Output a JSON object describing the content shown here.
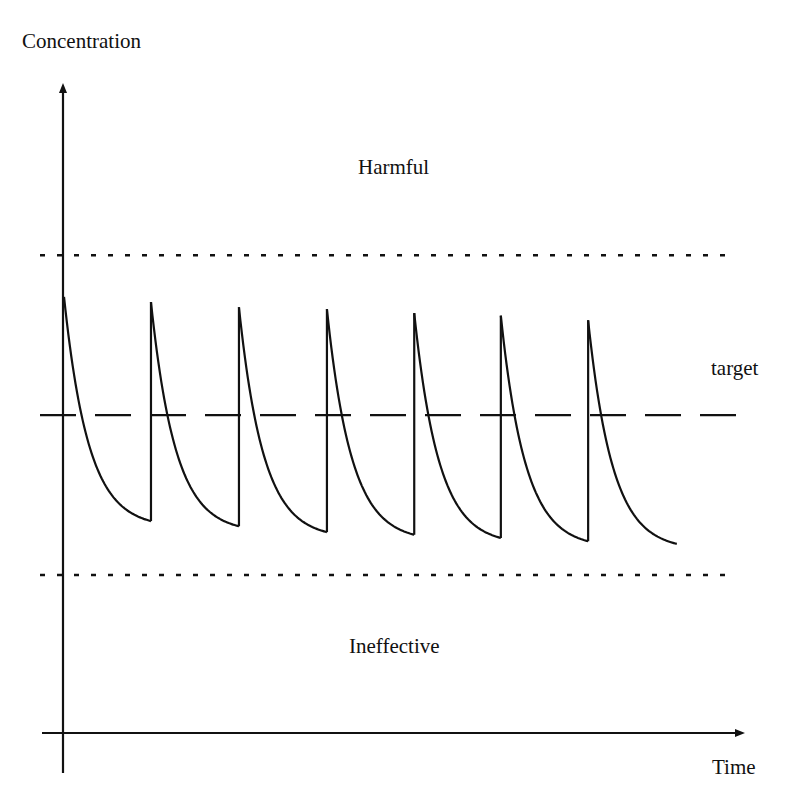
{
  "chart_data": {
    "type": "line",
    "title": "",
    "xlabel": "Time",
    "ylabel": "Concentration",
    "xlim": [
      0,
      100
    ],
    "ylim": [
      0,
      100
    ],
    "grid": false,
    "axis_ticks": false,
    "levels": {
      "harmful_threshold": 73.5,
      "target": 48.9,
      "ineffective_threshold": 24.3
    },
    "zone_labels": {
      "upper": "Harmful",
      "target": "target",
      "lower": "Ineffective"
    },
    "doses": [
      {
        "time": 0.15,
        "peak": 67.1,
        "trough_before_next": 32.6
      },
      {
        "time": 12.9,
        "peak": 66.3,
        "trough_before_next": 31.8
      },
      {
        "time": 25.8,
        "peak": 65.5,
        "trough_before_next": 30.9
      },
      {
        "time": 38.7,
        "peak": 65.2,
        "trough_before_next": 30.5
      },
      {
        "time": 51.5,
        "peak": 64.6,
        "trough_before_next": 30.0
      },
      {
        "time": 64.2,
        "peak": 64.2,
        "trough_before_next": 29.5
      },
      {
        "time": 77.0,
        "peak": 63.5,
        "trough_before_next": 29.1
      }
    ],
    "end_time": 90.0,
    "series": [
      {
        "name": "drug concentration",
        "style": "solid",
        "color": "#111111"
      }
    ],
    "reference_lines": [
      {
        "name": "harmful threshold",
        "value": 73.5,
        "style": "dotted"
      },
      {
        "name": "target",
        "value": 48.9,
        "style": "dashed"
      },
      {
        "name": "ineffective threshold",
        "value": 24.3,
        "style": "dotted"
      }
    ],
    "colors": {
      "ink": "#111111",
      "background": "#ffffff"
    }
  }
}
